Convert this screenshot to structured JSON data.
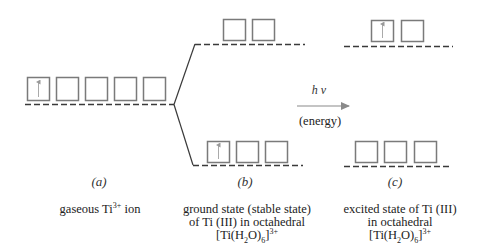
{
  "labels": {
    "a": "(a)",
    "b": "(b)",
    "c": "(c)"
  },
  "arrow": {
    "top_label": "h ν",
    "bottom_label": "(energy)"
  },
  "captions": {
    "a": {
      "prefix": "gaseous Ti",
      "superscript": "3+",
      "suffix": " ion"
    },
    "b": {
      "line1": "ground state (stable state)",
      "line2": "of Ti (III) in octahedral",
      "formula_prefix": "[Ti(H",
      "formula_sub1": "2",
      "formula_mid": "O)",
      "formula_sub2": "6",
      "formula_end": "]",
      "formula_sup": "3+"
    },
    "c": {
      "line1": "excited state of Ti (III)",
      "line2": "in octahedral",
      "formula_prefix": "[Ti(H",
      "formula_sub1": "2",
      "formula_mid": "O)",
      "formula_sub2": "6",
      "formula_end": "]",
      "formula_sup": "3+"
    }
  },
  "orbitals": {
    "a_degenerate": {
      "count": 5,
      "electrons": [
        1,
        0,
        0,
        0,
        0
      ]
    },
    "b_eg": {
      "count": 2,
      "electrons": [
        0,
        0
      ]
    },
    "b_t2g": {
      "count": 3,
      "electrons": [
        1,
        0,
        0
      ]
    },
    "c_eg": {
      "count": 2,
      "electrons": [
        1,
        0
      ]
    },
    "c_t2g": {
      "count": 3,
      "electrons": [
        0,
        0,
        0
      ]
    }
  },
  "colors": {
    "box": "#7a7a7a",
    "dash": "#3a3a3a",
    "arrow": "#8a8a8a",
    "text": "#222222"
  }
}
